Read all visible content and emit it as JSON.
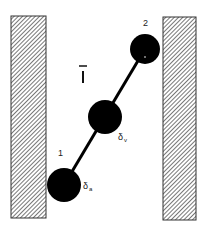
{
  "diagram": {
    "walls": [
      {
        "id": "left-wall",
        "x": 11,
        "y": 16,
        "width": 35,
        "height": 202
      },
      {
        "id": "right-wall",
        "x": 163,
        "y": 17,
        "width": 33,
        "height": 203
      }
    ],
    "spheres": [
      {
        "id": "sphere-1",
        "cx": 64,
        "cy": 185,
        "r": 17,
        "label": "1",
        "delta_label": "δ",
        "delta_sub": "a"
      },
      {
        "id": "sphere-middle",
        "cx": 105,
        "cy": 117,
        "r": 17,
        "delta_label": "δ",
        "delta_sub": "v"
      },
      {
        "id": "sphere-2",
        "cx": 145,
        "cy": 49,
        "r": 15,
        "label": "2"
      }
    ],
    "center_label": "l̄",
    "labels": {
      "node1": "1",
      "node2": "2",
      "delta": "δ",
      "sub_a": "a",
      "sub_v": "v"
    },
    "colors": {
      "sphere": "#000000",
      "wall_border": "#333333",
      "hatch": "#555555",
      "background": "#ffffff"
    }
  }
}
